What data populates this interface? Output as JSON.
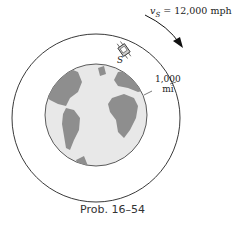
{
  "figure": {
    "caption": "Prob. 16–54",
    "velocity_label_symbol": "v",
    "velocity_label_subscript": "S",
    "velocity_label_value": " = 12,000 mph",
    "satellite_label": "S",
    "altitude_label_line1": "1,000",
    "altitude_label_line2": "mi"
  },
  "colors": {
    "ocean": "#e8e8e8",
    "land": "#8e8e8e",
    "orbit": "#222222"
  }
}
